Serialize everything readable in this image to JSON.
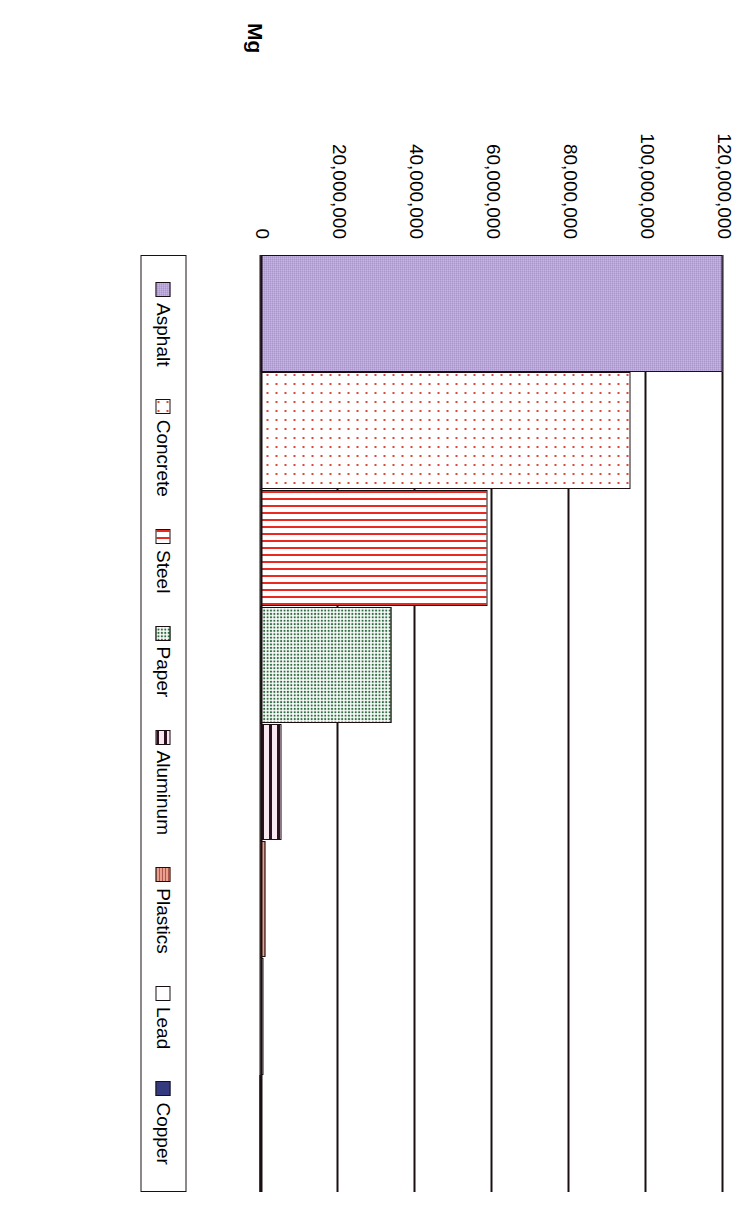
{
  "chart_data": {
    "type": "bar",
    "orientation": "horizontal",
    "title": "",
    "xlabel": "",
    "ylabel": "Mg",
    "axis_unit_label": "Mg",
    "categories": [
      "Asphalt",
      "Concrete",
      "Steel",
      "Paper",
      "Aluminum",
      "Plastics",
      "Lead",
      "Copper"
    ],
    "values": [
      120000000,
      96000000,
      59000000,
      34000000,
      5500000,
      1400000,
      800000,
      300000
    ],
    "tick_labels": [
      "120,000,000",
      "100,000,000",
      "80,000,000",
      "60,000,000",
      "40,000,000",
      "20,000,000",
      "0"
    ],
    "tick_values": [
      120000000,
      100000000,
      80000000,
      60000000,
      40000000,
      20000000,
      0
    ],
    "xlim": [
      0,
      120000000
    ],
    "grid": true,
    "legend_position": "right",
    "series": [
      {
        "name": "Asphalt",
        "value": 120000000,
        "color": "#ab95d1",
        "pattern": "solid"
      },
      {
        "name": "Concrete",
        "value": 96000000,
        "color": "#ffffff",
        "pattern": "red-dots"
      },
      {
        "name": "Steel",
        "value": 59000000,
        "color": "#ffffff",
        "pattern": "red-vertical-stripes"
      },
      {
        "name": "Paper",
        "value": 34000000,
        "color": "#2f6b40",
        "pattern": "green-checker"
      },
      {
        "name": "Aluminum",
        "value": 5500000,
        "color": "#f4e2ef",
        "pattern": "dark-horizontal-stripes"
      },
      {
        "name": "Plastics",
        "value": 1400000,
        "color": "#e9a08f",
        "pattern": "salmon-hatch"
      },
      {
        "name": "Lead",
        "value": 800000,
        "color": "#ffffff",
        "pattern": "plain"
      },
      {
        "name": "Copper",
        "value": 300000,
        "color": "#343a7e",
        "pattern": "solid"
      }
    ]
  },
  "axis": {
    "title": "Mg",
    "ticks": [
      {
        "label": "120,000,000"
      },
      {
        "label": "100,000,000"
      },
      {
        "label": "80,000,000"
      },
      {
        "label": "60,000,000"
      },
      {
        "label": "40,000,000"
      },
      {
        "label": "20,000,000"
      },
      {
        "label": "0"
      }
    ]
  },
  "legend": {
    "items": [
      {
        "label": "Asphalt"
      },
      {
        "label": "Concrete"
      },
      {
        "label": "Steel"
      },
      {
        "label": "Paper"
      },
      {
        "label": "Aluminum"
      },
      {
        "label": "Plastics"
      },
      {
        "label": "Lead"
      },
      {
        "label": "Copper"
      }
    ]
  }
}
